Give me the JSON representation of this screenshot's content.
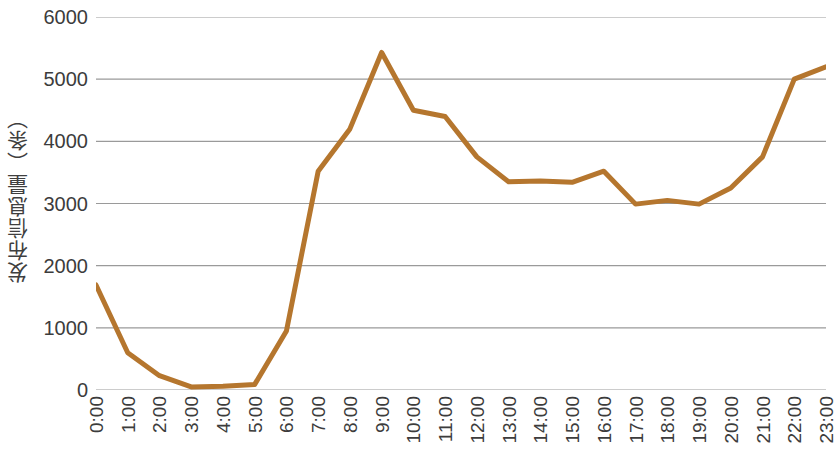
{
  "chart_data": {
    "type": "line",
    "title": "",
    "subtitle": "",
    "xlabel": "",
    "ylabel": "发布信息量（条）",
    "categories": [
      "0:00",
      "1:00",
      "2:00",
      "3:00",
      "4:00",
      "5:00",
      "6:00",
      "7:00",
      "8:00",
      "9:00",
      "10:00",
      "11:00",
      "12:00",
      "13:00",
      "14:00",
      "15:00",
      "16:00",
      "17:00",
      "18:00",
      "19:00",
      "20:00",
      "21:00",
      "22:00",
      "23:00"
    ],
    "values": [
      1690,
      600,
      230,
      50,
      60,
      90,
      950,
      3520,
      4200,
      5430,
      4500,
      4400,
      3750,
      3350,
      3360,
      3340,
      3520,
      2990,
      3050,
      2990,
      3250,
      3750,
      5000,
      5200
    ],
    "series": [
      {
        "name": "发布信息量",
        "color": "#B5762E",
        "values": [
          1690,
          600,
          230,
          50,
          60,
          90,
          950,
          3520,
          4200,
          5430,
          4500,
          4400,
          3750,
          3350,
          3360,
          3340,
          3520,
          2990,
          3050,
          2990,
          3250,
          3750,
          5000,
          5200
        ]
      }
    ],
    "ylim": [
      0,
      6000
    ],
    "ytick_labels": [
      "0",
      "1000",
      "2000",
      "3000",
      "4000",
      "5000",
      "6000"
    ],
    "ytick_values": [
      0,
      1000,
      2000,
      3000,
      4000,
      5000,
      6000
    ],
    "grid": true,
    "grid_axis": "y",
    "grid_color": "#9a9a9a",
    "legend": false,
    "legend_position": "none",
    "line_width": 5,
    "markers": false,
    "background": "#ffffff"
  }
}
